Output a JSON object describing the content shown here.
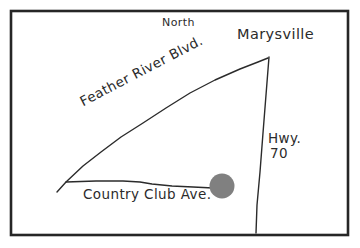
{
  "figure": {
    "kind": "hand-drawn-location-map",
    "background_color": "#ffffff",
    "frame_color": "#262626",
    "ink_color": "#2b2b2b",
    "marker_color": "#808080"
  },
  "labels": {
    "north": "North",
    "marysville": "Marysville",
    "feather_river_blvd": "Feather River Blvd.",
    "hwy_name": "Hwy.",
    "hwy_number": "70",
    "country_club_ave": "Country Club Ave."
  },
  "roads": [
    {
      "name": "Feather River Blvd.",
      "style": "curved-diagonal",
      "path": "M57,192 L66,182 L83,166 L101,152 L121,137 L143,123 L166,108 L190,93 L215,80 L240,69 L258,62 L268,58"
    },
    {
      "name": "Country Club Ave.",
      "style": "near-horizontal",
      "path": "M66,182 L96,181 L123,181 L140,182 L152,184 L172,186 L193,187 L213,188"
    },
    {
      "name": "Hwy. 70",
      "style": "near-vertical",
      "path": "M269,57 L266,95 L263,133 L260,172 L257,205 L256,233"
    }
  ],
  "marker": {
    "name": "site-location-marker",
    "shape": "circle",
    "cx": 222,
    "cy": 186,
    "r": 12.5,
    "fill": "#808080"
  },
  "frame": {
    "x": 11,
    "y": 11,
    "width": 337,
    "height": 224,
    "stroke_width": 2.6
  }
}
